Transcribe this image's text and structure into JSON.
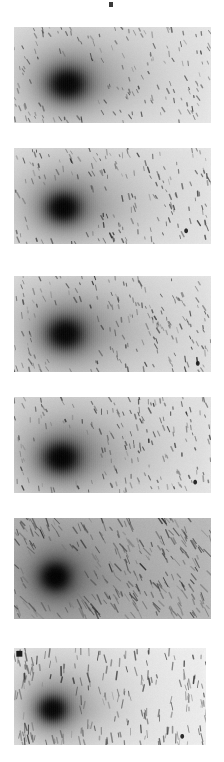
{
  "figure": {
    "title": "",
    "background_color": "#ffffff",
    "width": 224,
    "height": 762,
    "panel_count": 6,
    "top_artifact": {
      "name": "top-edge-artifact",
      "x": 109,
      "y": 2,
      "width": 4,
      "height": 5,
      "color": "#3a3a3a"
    }
  },
  "chart_data": {
    "type": "heatmap",
    "title": "",
    "subtitle": "",
    "xlabel": "",
    "ylabel": "",
    "legend": [],
    "grid": false,
    "colormap": "inverted-grayscale",
    "panels": [
      {
        "index": 1,
        "name": "frame-1",
        "x": 14,
        "y": 27,
        "width": 197,
        "height": 96,
        "background_level": "#ededed",
        "noise_level": 0.34,
        "noise_elongation": 1.7,
        "noise_angle": 68,
        "core": {
          "cx": 0.27,
          "cy": 0.59,
          "rx": 0.115,
          "ry": 0.195,
          "peak": "#0a0a0a"
        },
        "coma": {
          "cx": 0.3,
          "cy": 0.52,
          "rx": 0.26,
          "ry": 0.43,
          "level": "#9a9a9a"
        },
        "tail": {
          "x0": 0.3,
          "y0": 0.6,
          "x1": 0.6,
          "y1": 0.62,
          "thickness": 0.1,
          "level": "#a8a8a8"
        },
        "striping": "vertical",
        "dark_specks": 0
      },
      {
        "index": 2,
        "name": "frame-2",
        "x": 14,
        "y": 148,
        "width": 197,
        "height": 96,
        "background_level": "#ebebeb",
        "noise_level": 0.38,
        "noise_elongation": 1.8,
        "noise_angle": 72,
        "core": {
          "cx": 0.25,
          "cy": 0.62,
          "rx": 0.105,
          "ry": 0.185,
          "peak": "#080808"
        },
        "coma": {
          "cx": 0.28,
          "cy": 0.55,
          "rx": 0.25,
          "ry": 0.42,
          "level": "#989898"
        },
        "tail": {
          "x0": 0.28,
          "y0": 0.63,
          "x1": 0.58,
          "y1": 0.66,
          "thickness": 0.1,
          "level": "#a6a6a6"
        },
        "striping": "vertical",
        "dark_specks": 1
      },
      {
        "index": 3,
        "name": "frame-3",
        "x": 14,
        "y": 276,
        "width": 197,
        "height": 96,
        "background_level": "#ebebeb",
        "noise_level": 0.4,
        "noise_elongation": 1.9,
        "noise_angle": 70,
        "core": {
          "cx": 0.26,
          "cy": 0.6,
          "rx": 0.11,
          "ry": 0.195,
          "peak": "#0a0a0a"
        },
        "coma": {
          "cx": 0.3,
          "cy": 0.53,
          "rx": 0.27,
          "ry": 0.45,
          "level": "#959595"
        },
        "tail": {
          "x0": 0.3,
          "y0": 0.6,
          "x1": 0.62,
          "y1": 0.62,
          "thickness": 0.11,
          "level": "#a5a5a5"
        },
        "striping": "vertical",
        "dark_specks": 1
      },
      {
        "index": 4,
        "name": "frame-4",
        "x": 14,
        "y": 397,
        "width": 197,
        "height": 96,
        "background_level": "#eaeaea",
        "noise_level": 0.4,
        "noise_elongation": 1.8,
        "noise_angle": 74,
        "core": {
          "cx": 0.24,
          "cy": 0.63,
          "rx": 0.11,
          "ry": 0.19,
          "peak": "#070707"
        },
        "coma": {
          "cx": 0.28,
          "cy": 0.56,
          "rx": 0.26,
          "ry": 0.44,
          "level": "#939393"
        },
        "tail": {
          "x0": 0.28,
          "y0": 0.64,
          "x1": 0.6,
          "y1": 0.66,
          "thickness": 0.11,
          "level": "#a4a4a4"
        },
        "striping": "vertical",
        "dark_specks": 1
      },
      {
        "index": 5,
        "name": "frame-5",
        "x": 14,
        "y": 518,
        "width": 197,
        "height": 101,
        "background_level": "#b9b9b9",
        "noise_level": 0.55,
        "noise_elongation": 3.2,
        "noise_angle": 58,
        "core": {
          "cx": 0.21,
          "cy": 0.58,
          "rx": 0.095,
          "ry": 0.175,
          "peak": "#050505"
        },
        "coma": {
          "cx": 0.24,
          "cy": 0.55,
          "rx": 0.2,
          "ry": 0.38,
          "level": "#7d7d7d"
        },
        "tail": {
          "x0": 0.24,
          "y0": 0.59,
          "x1": 0.62,
          "y1": 0.63,
          "thickness": 0.09,
          "level": "#8e8e8e"
        },
        "striping": "diagonal",
        "dark_specks": 0
      },
      {
        "index": 6,
        "name": "frame-6",
        "x": 14,
        "y": 648,
        "width": 192,
        "height": 97,
        "background_level": "#efefef",
        "noise_level": 0.42,
        "noise_elongation": 3.0,
        "noise_angle": 88,
        "core": {
          "cx": 0.2,
          "cy": 0.63,
          "rx": 0.09,
          "ry": 0.16,
          "peak": "#0b0b0b"
        },
        "coma": {
          "cx": 0.23,
          "cy": 0.56,
          "rx": 0.2,
          "ry": 0.38,
          "level": "#9d9d9d"
        },
        "tail": {
          "x0": 0.23,
          "y0": 0.63,
          "x1": 0.48,
          "y1": 0.64,
          "thickness": 0.09,
          "level": "#aaaaaa"
        },
        "striping": "vertical",
        "dark_specks": 1,
        "corner_marker": {
          "name": "corner-square-artifact",
          "x": 0.012,
          "y": 0.03,
          "size": 0.035,
          "color": "#1a1a1a"
        }
      }
    ]
  }
}
